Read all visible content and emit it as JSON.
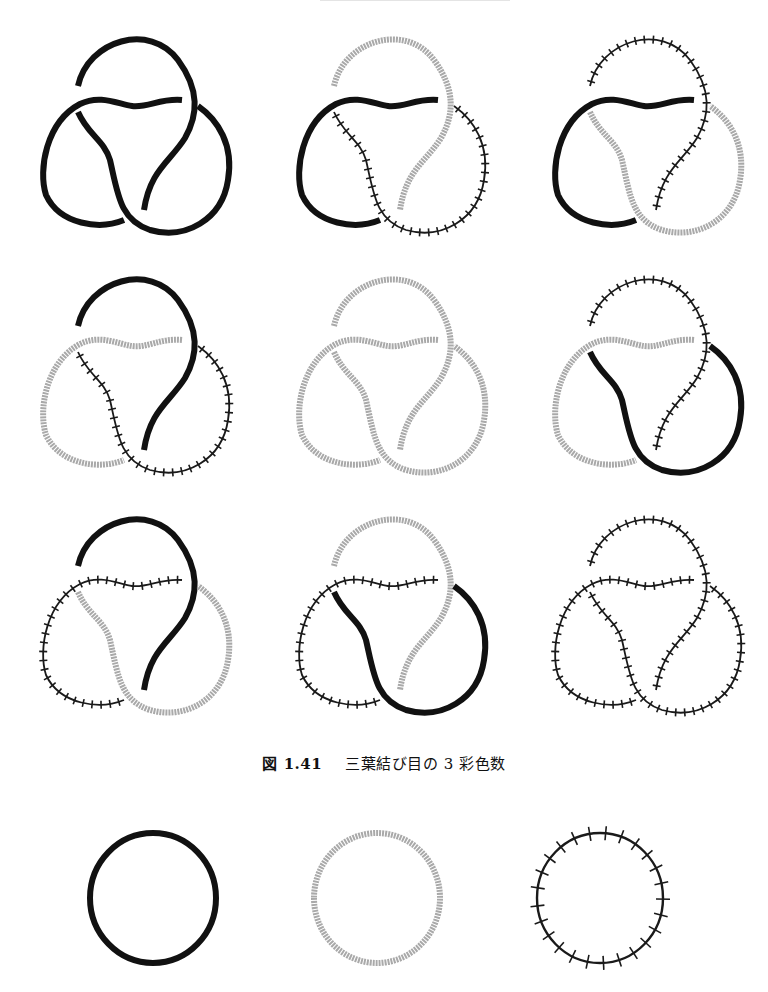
{
  "header": {
    "text": ""
  },
  "colors": {
    "black": "#111111",
    "grey": "#a9a9a9",
    "ticked": "#1a1a1a",
    "background": "#ffffff"
  },
  "legend_styles": [
    "black-solid",
    "grey-textured",
    "black-ticked"
  ],
  "figure": {
    "number": "図 1.41",
    "title": "三葉結び目の 3 彩色数",
    "panels": [
      {
        "row": 1,
        "col": 1,
        "arcs": {
          "top": "black",
          "left": "black",
          "right": "black"
        }
      },
      {
        "row": 1,
        "col": 2,
        "arcs": {
          "top": "grey",
          "left": "black",
          "right": "ticked"
        }
      },
      {
        "row": 1,
        "col": 3,
        "arcs": {
          "top": "ticked",
          "left": "black",
          "right": "grey"
        }
      },
      {
        "row": 2,
        "col": 1,
        "arcs": {
          "top": "black",
          "left": "grey",
          "right": "ticked"
        }
      },
      {
        "row": 2,
        "col": 2,
        "arcs": {
          "top": "grey",
          "left": "grey",
          "right": "grey"
        }
      },
      {
        "row": 2,
        "col": 3,
        "arcs": {
          "top": "ticked",
          "left": "grey",
          "right": "black"
        }
      },
      {
        "row": 3,
        "col": 1,
        "arcs": {
          "top": "black",
          "left": "ticked",
          "right": "grey"
        }
      },
      {
        "row": 3,
        "col": 2,
        "arcs": {
          "top": "grey",
          "left": "ticked",
          "right": "black"
        }
      },
      {
        "row": 3,
        "col": 3,
        "arcs": {
          "top": "ticked",
          "left": "ticked",
          "right": "ticked"
        }
      }
    ]
  },
  "unknots": [
    {
      "style": "black"
    },
    {
      "style": "grey"
    },
    {
      "style": "ticked"
    }
  ]
}
